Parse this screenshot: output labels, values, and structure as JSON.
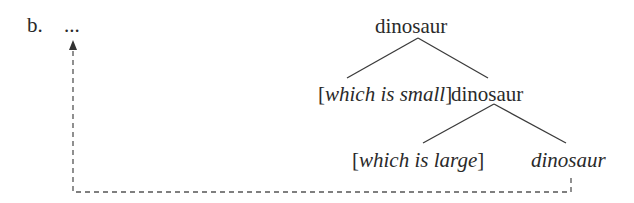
{
  "example": {
    "label": "b.",
    "ellipsis": "..."
  },
  "tree": {
    "root": "dinosaur",
    "level1_left_open": "[",
    "level1_left_text": "which is small",
    "level1_left_close": "]",
    "level1_right": "dinosaur",
    "level2_left_open": "[",
    "level2_left_text": "which is large",
    "level2_left_close": "]",
    "level2_right": "dinosaur"
  },
  "colors": {
    "text": "#2a2a2a",
    "lines": "#3a3a3a"
  }
}
